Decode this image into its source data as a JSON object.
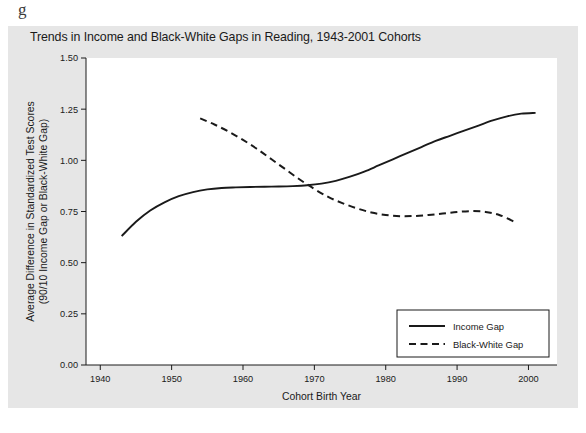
{
  "figure": {
    "page_stub": "g",
    "background_color": "#e6e6e6",
    "plot_background_color": "#ffffff",
    "line_color": "#1a1a1a"
  },
  "chart_data": {
    "type": "line",
    "title": "Trends in Income and Black-White Gaps in Reading, 1943-2001 Cohorts",
    "xlabel": "Cohort Birth Year",
    "ylabel": "Average Difference in Standardized Test Scores\n(90/10 Income Gap or Black-White Gap)",
    "ylabel_line1": "Average Difference in Standardized Test Scores",
    "ylabel_line2": "(90/10 Income Gap or Black-White Gap)",
    "xlim": [
      1938,
      2004
    ],
    "ylim": [
      0.0,
      1.5
    ],
    "xticks": [
      1940,
      1950,
      1960,
      1970,
      1980,
      1990,
      2000
    ],
    "xtick_labels": [
      "1940",
      "1950",
      "1960",
      "1970",
      "1980",
      "1990",
      "2000"
    ],
    "yticks": [
      0.0,
      0.25,
      0.5,
      0.75,
      1.0,
      1.25,
      1.5
    ],
    "ytick_labels": [
      "0.00",
      "0.25",
      "0.50",
      "0.75",
      "1.00",
      "1.25",
      "1.50"
    ],
    "grid": false,
    "legend_position": "lower right",
    "series": [
      {
        "name": "Income Gap",
        "style": "solid",
        "x": [
          1943,
          1945,
          1947,
          1949,
          1951,
          1953,
          1955,
          1957,
          1959,
          1961,
          1963,
          1965,
          1967,
          1969,
          1971,
          1973,
          1975,
          1977,
          1979,
          1981,
          1983,
          1985,
          1987,
          1989,
          1991,
          1993,
          1995,
          1997,
          1999,
          2001
        ],
        "y": [
          0.63,
          0.7,
          0.755,
          0.795,
          0.825,
          0.845,
          0.858,
          0.865,
          0.868,
          0.87,
          0.871,
          0.872,
          0.874,
          0.878,
          0.886,
          0.9,
          0.92,
          0.945,
          0.975,
          1.005,
          1.035,
          1.065,
          1.095,
          1.12,
          1.145,
          1.17,
          1.195,
          1.215,
          1.228,
          1.232
        ]
      },
      {
        "name": "Black-White Gap",
        "style": "dashed",
        "x": [
          1954,
          1956,
          1958,
          1960,
          1962,
          1964,
          1966,
          1968,
          1970,
          1972,
          1974,
          1976,
          1978,
          1980,
          1982,
          1984,
          1986,
          1988,
          1990,
          1992,
          1994,
          1996,
          1998
        ],
        "y": [
          1.205,
          1.175,
          1.14,
          1.1,
          1.055,
          1.005,
          0.955,
          0.905,
          0.86,
          0.82,
          0.79,
          0.765,
          0.745,
          0.733,
          0.727,
          0.728,
          0.733,
          0.74,
          0.748,
          0.752,
          0.748,
          0.732,
          0.7
        ]
      }
    ]
  },
  "legend": {
    "items": [
      {
        "label": "Income Gap",
        "style": "solid"
      },
      {
        "label": "Black-White Gap",
        "style": "dashed"
      }
    ]
  }
}
